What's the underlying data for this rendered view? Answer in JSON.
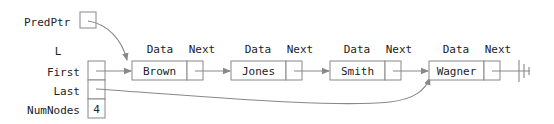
{
  "diagram": {
    "pred_ptr_label": "PredPtr",
    "list_name": "L",
    "fields": [
      {
        "name": "First",
        "value": ""
      },
      {
        "name": "Last",
        "value": ""
      },
      {
        "name": "NumNodes",
        "value": "4"
      }
    ],
    "node_headers": {
      "data": "Data",
      "next": "Next"
    },
    "nodes": [
      {
        "data": "Brown"
      },
      {
        "data": "Jones"
      },
      {
        "data": "Smith"
      },
      {
        "data": "Wagner"
      }
    ],
    "terminator": "null-ground-symbol",
    "colors": {
      "line": "#888888",
      "text": "#222222"
    }
  }
}
